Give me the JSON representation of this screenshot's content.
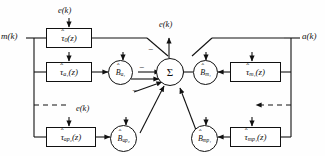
{
  "diagram": {
    "io_labels": {
      "input_left": "m(k)",
      "input_right": "a(k)",
      "error": "e(k)"
    },
    "error_taps": [
      {
        "id": "error-tap-top-left",
        "label": "e(k)"
      },
      {
        "id": "error-tap-center",
        "label": "e(k)"
      },
      {
        "id": "error-tap-mid-left",
        "label": "e(k)"
      }
    ],
    "sum_node": {
      "label": "Σ",
      "name": "summing-junction"
    },
    "signs": [
      {
        "id": "sign-top",
        "label": "−"
      },
      {
        "id": "sign-upper-left",
        "label": "−"
      },
      {
        "id": "sign-lower-left",
        "label": "−"
      }
    ],
    "filter_blocks": [
      {
        "id": "tau-0",
        "tau": "τ",
        "sub": "0",
        "arg": "(z)",
        "side": "left"
      },
      {
        "id": "tau-a1",
        "tau": "τ",
        "sub": "a₁",
        "arg": "(z)",
        "side": "left"
      },
      {
        "id": "tau-ap2",
        "tau": "τ",
        "sub": "ap₂",
        "arg": "(z)",
        "side": "left"
      },
      {
        "id": "tau-m1",
        "tau": "τ",
        "sub": "m₁",
        "arg": "(z)",
        "side": "right"
      },
      {
        "id": "tau-mp1",
        "tau": "τ",
        "sub": "mp₁",
        "arg": "(z)",
        "side": "right"
      }
    ],
    "gain_nodes": [
      {
        "id": "B-a1",
        "b": "B",
        "sub": "a₁",
        "side": "left"
      },
      {
        "id": "B-ap2",
        "b": "B",
        "sub": "ap₂",
        "side": "left"
      },
      {
        "id": "B-m1",
        "b": "B",
        "sub": "m₁",
        "side": "right"
      },
      {
        "id": "B-mp1",
        "b": "B",
        "sub": "mp₁",
        "side": "right"
      }
    ],
    "dashed_continuations": [
      {
        "id": "dashes-left",
        "style": "dashed"
      },
      {
        "id": "dashes-right",
        "style": "dashed"
      }
    ],
    "colors": {
      "stroke": "#111111",
      "background": "#ffffff"
    }
  }
}
